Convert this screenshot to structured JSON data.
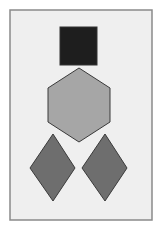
{
  "diagram": {
    "background": "#ffffff",
    "frame": {
      "x": 10,
      "y": 10,
      "width": 142,
      "height": 210,
      "fill": "#efefef",
      "stroke": "#8a8a8a"
    },
    "shapes": [
      {
        "type": "square",
        "name": "black-square",
        "x": 60,
        "y": 27,
        "width": 37,
        "height": 38,
        "fill": "#1e1e1e",
        "stroke": "#333333"
      },
      {
        "type": "hexagon",
        "name": "gray-hexagon",
        "points": "79,68 110,88 110,122 79,142 48,122 48,88",
        "fill": "#a6a6a6",
        "stroke": "#3a3a3a"
      },
      {
        "type": "diamond",
        "name": "left-diamond",
        "points": "53,134 75,168 53,201 30,168",
        "fill": "#6e6e6e",
        "stroke": "#3a3a3a"
      },
      {
        "type": "diamond",
        "name": "right-diamond",
        "points": "105,134 127,168 105,201 82,168",
        "fill": "#6e6e6e",
        "stroke": "#3a3a3a"
      }
    ]
  }
}
